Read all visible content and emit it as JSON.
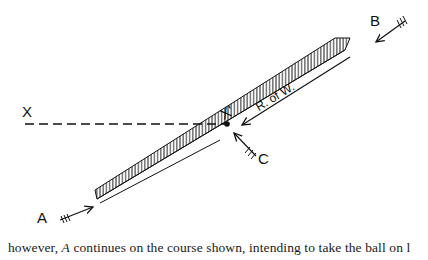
{
  "diagram": {
    "labels": {
      "a": "A",
      "b": "B",
      "c": "C",
      "x": "X",
      "x_prime": "X'",
      "strip": "R. of W."
    },
    "colors": {
      "ink": "#111111",
      "background": "#ffffff"
    }
  },
  "caption": {
    "pre": "however, ",
    "italic": "A",
    "post": " continues on the course shown, intending to take the ball on l"
  }
}
